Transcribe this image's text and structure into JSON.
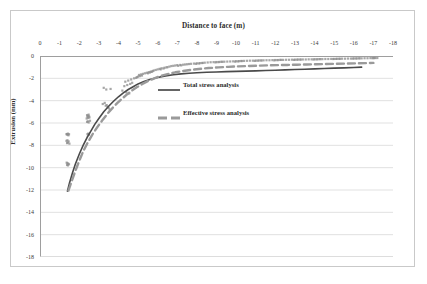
{
  "chart_data": {
    "type": "scatter",
    "title": "Distance to face (m)",
    "xlabel": "Distance to face (m)",
    "ylabel": "Extrusion (mm)",
    "xlim": [
      0,
      -18
    ],
    "ylim": [
      0,
      -18
    ],
    "grid": true,
    "legend_position": "inside-center",
    "xticks": [
      0,
      -1,
      -2,
      -3,
      -4,
      -5,
      -6,
      -7,
      -8,
      -9,
      -10,
      -11,
      -12,
      -13,
      -14,
      -15,
      -16,
      -17,
      -18
    ],
    "xtick_labels": [
      "0",
      "-1",
      "-2",
      "-3",
      "-4",
      "-5",
      "-6",
      "-7",
      "-8",
      "-9",
      "-10",
      "-11",
      "-12",
      "-13",
      "-14",
      "-15",
      "-16",
      "-17",
      "-18"
    ],
    "yticks": [
      0,
      -2,
      -4,
      -6,
      -8,
      -10,
      -12,
      -14,
      -16,
      -18
    ],
    "ytick_labels": [
      "0",
      "-2",
      "-4",
      "-6",
      "-8",
      "-10",
      "-12",
      "-14",
      "-16",
      "-18"
    ],
    "axis_position": "x-axis-on-top",
    "series": [
      {
        "name": "Total stress analysis",
        "type": "line",
        "style": "solid",
        "color": "#4a4a4a",
        "width": 1.6,
        "x": [
          -1.4,
          -1.5,
          -1.65,
          -1.8,
          -2.0,
          -2.2,
          -2.4,
          -2.6,
          -2.8,
          -3.0,
          -3.25,
          -3.5,
          -3.75,
          -4.0,
          -4.25,
          -4.5,
          -4.75,
          -5.0,
          -5.3,
          -5.6,
          -6.0,
          -6.4,
          -6.8,
          -7.2,
          -7.6,
          -8.0,
          -8.5,
          -9.0,
          -9.5,
          -10.0,
          -10.5,
          -11.0,
          -11.5,
          -12.0,
          -12.5,
          -13.0,
          -13.5,
          -14.0,
          -14.5,
          -15.0,
          -15.5,
          -16.0,
          -16.4
        ],
        "y": [
          -12.1,
          -11.4,
          -10.5,
          -9.7,
          -8.8,
          -8.0,
          -7.3,
          -6.7,
          -6.1,
          -5.6,
          -5.0,
          -4.5,
          -4.05,
          -3.65,
          -3.3,
          -3.0,
          -2.75,
          -2.5,
          -2.28,
          -2.1,
          -1.92,
          -1.78,
          -1.68,
          -1.6,
          -1.55,
          -1.5,
          -1.46,
          -1.43,
          -1.4,
          -1.38,
          -1.35,
          -1.33,
          -1.3,
          -1.27,
          -1.24,
          -1.21,
          -1.18,
          -1.15,
          -1.12,
          -1.09,
          -1.06,
          -1.03,
          -1.0
        ]
      },
      {
        "name": "Effective stress analysis",
        "type": "line",
        "style": "dashed",
        "color": "#9a9a9a",
        "width": 2.4,
        "x": [
          -1.45,
          -1.6,
          -1.8,
          -2.0,
          -2.2,
          -2.45,
          -2.7,
          -2.95,
          -3.2,
          -3.45,
          -3.7,
          -3.95,
          -4.2,
          -4.45,
          -4.7,
          -4.95,
          -5.2,
          -5.5,
          -5.8,
          -6.1,
          -6.5,
          -6.9,
          -7.3,
          -7.7,
          -8.1,
          -8.6,
          -9.1,
          -9.6,
          -10.1,
          -10.6,
          -11.1,
          -11.6,
          -12.1,
          -12.6,
          -13.1,
          -13.6,
          -14.1,
          -14.6,
          -15.1,
          -15.6,
          -16.1,
          -16.6,
          -17.0
        ],
        "y": [
          -12.05,
          -11.3,
          -10.3,
          -9.4,
          -8.55,
          -7.7,
          -6.95,
          -6.3,
          -5.7,
          -5.15,
          -4.65,
          -4.2,
          -3.8,
          -3.42,
          -3.08,
          -2.78,
          -2.52,
          -2.25,
          -2.02,
          -1.82,
          -1.62,
          -1.46,
          -1.34,
          -1.24,
          -1.16,
          -1.08,
          -1.02,
          -0.97,
          -0.93,
          -0.9,
          -0.87,
          -0.84,
          -0.82,
          -0.8,
          -0.78,
          -0.76,
          -0.74,
          -0.72,
          -0.7,
          -0.68,
          -0.66,
          -0.64,
          -0.62
        ]
      }
    ],
    "scatter_points": {
      "name": "Measured extrusion data",
      "marker": "square",
      "color": "#8e8e8e",
      "size": 2.2,
      "x": [
        -1.35,
        -1.38,
        -1.4,
        -1.42,
        -1.45,
        -1.48,
        -1.35,
        -1.4,
        -1.46,
        -1.38,
        -1.42,
        -1.5,
        -1.4,
        -1.44,
        -1.36,
        -1.48,
        -1.42,
        -1.38,
        -2.4,
        -2.44,
        -2.48,
        -2.42,
        -2.5,
        -2.46,
        -2.38,
        -2.52,
        -2.44,
        -2.4,
        -2.48,
        -2.55,
        -2.42,
        -2.5,
        -2.46,
        -3.2,
        -3.35,
        -3.45,
        -3.3,
        -3.5,
        -3.4,
        -3.55,
        -3.25,
        -3.6,
        -3.38,
        -4.2,
        -4.4,
        -4.55,
        -4.3,
        -4.6,
        -4.45,
        -4.7,
        -4.35,
        -4.5,
        -4.65,
        -4.8,
        -4.9,
        -5.0,
        -5.1,
        -5.2,
        -5.05,
        -4.95,
        -5.15,
        -5.25,
        -5.35,
        -5.45,
        -5.55,
        -5.65,
        -5.75,
        -5.5,
        -5.6,
        -5.7,
        -5.8,
        -5.9,
        -6.0,
        -6.1,
        -6.2,
        -6.35,
        -6.5,
        -6.15,
        -6.3,
        -6.45,
        -6.6,
        -6.7,
        -6.8,
        -6.9,
        -7.0,
        -7.15,
        -7.3,
        -7.05,
        -7.2,
        -7.4,
        -7.5,
        -7.6,
        -7.7,
        -7.85,
        -8.0,
        -8.15,
        -8.3,
        -7.95,
        -8.1,
        -8.25,
        -8.4,
        -8.55,
        -8.7,
        -8.85,
        -9.0,
        -9.15,
        -9.3,
        -8.95,
        -9.1,
        -9.25,
        -9.4,
        -9.55,
        -9.7,
        -9.85,
        -10.0,
        -10.15,
        -10.3,
        -9.95,
        -10.1,
        -10.25,
        -10.4,
        -10.55,
        -10.7,
        -10.85,
        -11.0,
        -11.15,
        -11.3,
        -10.95,
        -11.1,
        -11.25,
        -11.4,
        -11.55,
        -11.7,
        -11.85,
        -12.0,
        -12.15,
        -12.3,
        -11.95,
        -12.1,
        -12.25,
        -12.4,
        -12.55,
        -12.7,
        -12.85,
        -13.0,
        -13.15,
        -13.3,
        -12.95,
        -13.1,
        -13.25,
        -13.4,
        -13.55,
        -13.7,
        -13.85,
        -14.0,
        -14.15,
        -14.3,
        -13.95,
        -14.1,
        -14.25,
        -14.4,
        -14.55,
        -14.7,
        -14.85,
        -15.0,
        -15.15,
        -15.3,
        -14.95,
        -15.1,
        -15.25,
        -15.4,
        -15.55,
        -15.7,
        -15.85,
        -16.0,
        -16.15,
        -16.3,
        -15.95,
        -16.1,
        -16.25,
        -16.4,
        -16.55,
        -16.7,
        -16.85,
        -17.0,
        -17.1,
        -17.2,
        -16.95,
        -17.05
      ],
      "y": [
        -7.0,
        -7.0,
        -7.05,
        -6.95,
        -7.1,
        -7.0,
        -7.6,
        -7.55,
        -7.65,
        -7.8,
        -7.75,
        -7.85,
        -9.6,
        -9.65,
        -9.55,
        -9.7,
        -9.8,
        -9.75,
        -5.3,
        -5.35,
        -5.25,
        -5.45,
        -5.4,
        -5.55,
        -5.6,
        -5.5,
        -5.85,
        -5.9,
        -5.95,
        -5.8,
        -7.0,
        -7.05,
        -6.95,
        -4.3,
        -4.45,
        -4.55,
        -4.2,
        -4.65,
        -4.4,
        -4.8,
        -2.85,
        -2.95,
        -3.0,
        -3.1,
        -3.25,
        -3.35,
        -2.7,
        -2.5,
        -2.6,
        -2.4,
        -2.3,
        -2.2,
        -2.1,
        -2.0,
        -1.95,
        -1.85,
        -1.8,
        -1.75,
        -1.7,
        -1.9,
        -1.65,
        -1.6,
        -1.55,
        -1.5,
        -1.45,
        -1.4,
        -1.35,
        -1.55,
        -1.48,
        -1.42,
        -1.3,
        -1.25,
        -1.2,
        -1.15,
        -1.1,
        -1.05,
        -1.0,
        -1.2,
        -1.12,
        -1.02,
        -0.95,
        -0.9,
        -0.88,
        -0.85,
        -0.82,
        -0.8,
        -0.78,
        -0.88,
        -0.84,
        -0.76,
        -0.74,
        -0.72,
        -0.7,
        -0.68,
        -0.66,
        -0.64,
        -0.62,
        -0.7,
        -0.67,
        -0.63,
        -0.6,
        -0.58,
        -0.56,
        -0.55,
        -0.54,
        -0.53,
        -0.52,
        -0.57,
        -0.55,
        -0.52,
        -0.51,
        -0.5,
        -0.49,
        -0.48,
        -0.47,
        -0.46,
        -0.45,
        -0.5,
        -0.48,
        -0.45,
        -0.44,
        -0.43,
        -0.42,
        -0.42,
        -0.41,
        -0.4,
        -0.4,
        -0.44,
        -0.42,
        -0.4,
        -0.39,
        -0.38,
        -0.38,
        -0.37,
        -0.36,
        -0.36,
        -0.35,
        -0.39,
        -0.37,
        -0.35,
        -0.35,
        -0.34,
        -0.34,
        -0.33,
        -0.33,
        -0.32,
        -0.32,
        -0.35,
        -0.33,
        -0.32,
        -0.31,
        -0.31,
        -0.3,
        -0.3,
        -0.29,
        -0.29,
        -0.28,
        -0.31,
        -0.3,
        -0.28,
        -0.28,
        -0.27,
        -0.27,
        -0.26,
        -0.26,
        -0.25,
        -0.25,
        -0.27,
        -0.26,
        -0.25,
        -0.24,
        -0.24,
        -0.23,
        -0.23,
        -0.22,
        -0.22,
        -0.21,
        -0.23,
        -0.22,
        -0.21,
        -0.21,
        -0.2,
        -0.2,
        -0.19,
        -0.19,
        -0.18,
        -0.18,
        -0.19,
        -0.18
      ]
    }
  },
  "legend": {
    "entries": [
      {
        "label": "Total stress analysis",
        "style": "solid",
        "color": "#4a4a4a"
      },
      {
        "label": "Effective stress analysis",
        "style": "dashed",
        "color": "#9a9a9a"
      }
    ]
  },
  "colors": {
    "grid": "#d4d4d4",
    "axis": "#9e9e9e",
    "frame": "#c9c9c9",
    "text": "#2b2b2b",
    "total_stress": "#4a4a4a",
    "effective_stress": "#9a9a9a",
    "scatter": "#8e8e8e"
  }
}
